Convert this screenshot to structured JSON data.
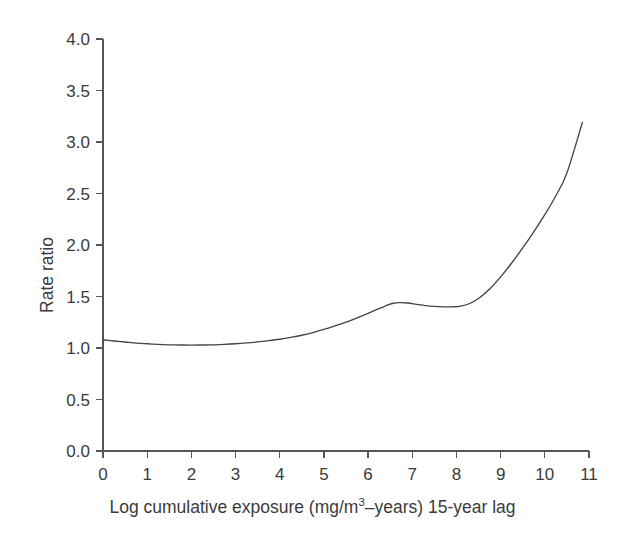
{
  "chart_data": {
    "type": "line",
    "title": "",
    "xlabel": "Log cumulative exposure (mg/m3–years) 15-year lag",
    "xlabel_prefix": "Log cumulative exposure (mg/m",
    "xlabel_sup": "3",
    "xlabel_suffix": "–years) 15-year lag",
    "ylabel": "Rate ratio",
    "xlim": [
      0,
      11
    ],
    "ylim": [
      0.0,
      4.0
    ],
    "xticks": [
      0,
      1,
      2,
      3,
      4,
      5,
      6,
      7,
      8,
      9,
      10,
      11
    ],
    "xtick_labels": [
      "0",
      "1",
      "2",
      "3",
      "4",
      "5",
      "6",
      "7",
      "8",
      "9",
      "10",
      "11"
    ],
    "yticks": [
      0.0,
      0.5,
      1.0,
      1.5,
      2.0,
      2.5,
      3.0,
      3.5,
      4.0
    ],
    "ytick_labels": [
      "0.0",
      "0.5",
      "1.0",
      "1.5",
      "2.0",
      "2.5",
      "3.0",
      "3.5",
      "4.0"
    ],
    "grid": false,
    "legend": "none",
    "line_color": "#444444",
    "axis_color": "#555555",
    "background_color": "#ffffff",
    "series": [
      {
        "name": "Rate ratio",
        "x": [
          0.0,
          0.25,
          0.5,
          0.75,
          1.0,
          1.25,
          1.5,
          1.75,
          2.0,
          2.25,
          2.5,
          2.75,
          3.0,
          3.25,
          3.5,
          3.75,
          4.0,
          4.25,
          4.5,
          4.75,
          5.0,
          5.25,
          5.5,
          5.75,
          6.0,
          6.2,
          6.4,
          6.55,
          6.7,
          6.9,
          7.1,
          7.3,
          7.5,
          7.7,
          7.9,
          8.1,
          8.3,
          8.5,
          8.75,
          9.0,
          9.25,
          9.5,
          9.75,
          10.0,
          10.25,
          10.5,
          10.85
        ],
        "y": [
          1.08,
          1.068,
          1.058,
          1.048,
          1.041,
          1.035,
          1.031,
          1.029,
          1.028,
          1.029,
          1.031,
          1.035,
          1.041,
          1.049,
          1.059,
          1.071,
          1.085,
          1.103,
          1.124,
          1.15,
          1.18,
          1.214,
          1.251,
          1.293,
          1.337,
          1.374,
          1.41,
          1.432,
          1.441,
          1.437,
          1.424,
          1.412,
          1.404,
          1.4,
          1.4,
          1.407,
          1.432,
          1.48,
          1.572,
          1.69,
          1.825,
          1.972,
          2.128,
          2.295,
          2.478,
          2.7,
          3.19
        ]
      }
    ],
    "annotations": []
  },
  "axes": {
    "y_axis_name": "y-axis",
    "x_axis_name": "x-axis"
  }
}
